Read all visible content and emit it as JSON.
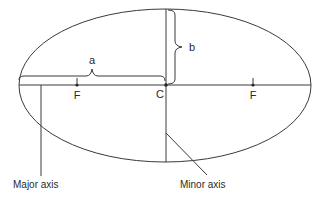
{
  "diagram": {
    "labels": {
      "semi_major": "a",
      "semi_minor": "b",
      "center": "C",
      "focus_left": "F",
      "focus_right": "F",
      "major_axis": "Major axis",
      "minor_axis": "Minor axis"
    },
    "colors": {
      "stroke": "#3a3a3a",
      "text": "#2a2a2a",
      "background": "#ffffff"
    }
  }
}
